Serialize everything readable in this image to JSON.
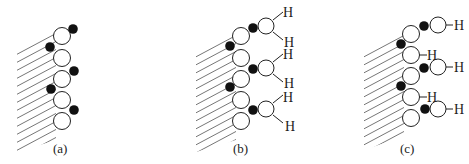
{
  "diagram": {
    "panels": [
      {
        "id": "a",
        "label": "(a)",
        "surface_atoms": 5,
        "adsorbates": 5,
        "hydrogens": []
      },
      {
        "id": "b",
        "label": "(b)",
        "surface_atoms": 5,
        "adsorbates": 5,
        "bonded_groups": 3,
        "hydrogens": [
          "H",
          "H",
          "H",
          "H",
          "H",
          "H"
        ]
      },
      {
        "id": "c",
        "label": "(c)",
        "surface_atoms": 5,
        "adsorbates": 5,
        "bonded_groups": 3,
        "hydrogens": [
          "H",
          "H",
          "H",
          "H",
          "H"
        ]
      }
    ],
    "legend": {
      "surface": "hatched substrate",
      "large_circle": "white atom",
      "small_filled_circle": "black atom",
      "H": "hydrogen"
    },
    "colors": {
      "stroke": "#222222",
      "fill_dark": "#111111",
      "fill_light": "#ffffff",
      "hatch": "#666666"
    }
  }
}
